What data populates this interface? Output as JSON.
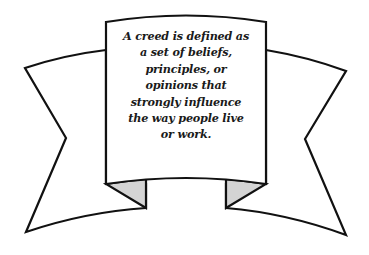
{
  "banner": {
    "lines": [
      "A creed is defined as",
      "a set of beliefs,",
      "principles, or",
      "opinions that",
      "strongly influence",
      "the way people live",
      "or work."
    ],
    "text": "A creed is defined as a set of beliefs, principles, or opinions that strongly influence the way people live or work.",
    "colors": {
      "stroke": "#111111",
      "fill": "#ffffff",
      "fold_shade": "#d4d4d4"
    }
  }
}
